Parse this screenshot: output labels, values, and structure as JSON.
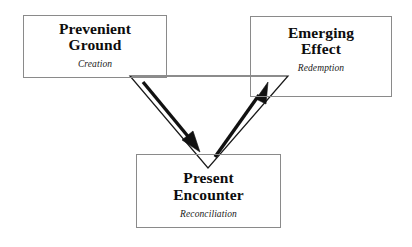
{
  "diagram": {
    "type": "triangular-cycle-diagram",
    "background_color": "#ffffff",
    "box_border_color": "#8a8a8a",
    "line_color": "#1a1a1a",
    "nodes": [
      {
        "id": "prevenient-ground",
        "title": "Prevenient\nGround",
        "subtitle": "Creation",
        "position": "top-left"
      },
      {
        "id": "emerging-effect",
        "title": "Emerging\nEffect",
        "subtitle": "Redemption",
        "position": "top-right"
      },
      {
        "id": "present-encounter",
        "title": "Present\nEncounter",
        "subtitle": "Reconciliation",
        "position": "bottom-center"
      }
    ],
    "connectors": [
      {
        "id": "arrow-ground-to-encounter",
        "from": "prevenient-ground",
        "to": "present-encounter",
        "direction": "down-right",
        "style": "thick-solid-arrow"
      },
      {
        "id": "arrow-encounter-to-effect",
        "from": "present-encounter",
        "to": "emerging-effect",
        "direction": "up-right",
        "style": "thick-solid-arrow"
      }
    ],
    "outline_shape": {
      "id": "inverted-triangle-outline",
      "vertices": [
        [
          130,
          76
        ],
        [
          288,
          76
        ],
        [
          208,
          168
        ]
      ],
      "stroke": "#1a1a1a",
      "stroke_width": 1.2,
      "fill": "none"
    }
  }
}
